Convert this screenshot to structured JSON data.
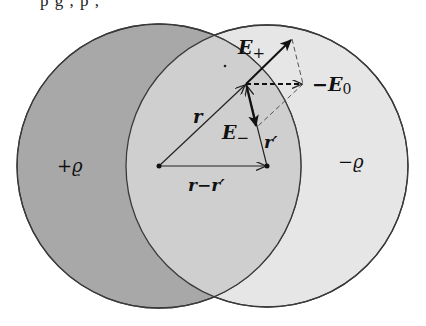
{
  "figure": {
    "top_cut_text": "p  g      ,        p          ,",
    "colors": {
      "background": "#ffffff",
      "left_sphere_fill": "#a8a8a8",
      "right_sphere_fill": "#e6e6e6",
      "overlap_fill": "#cfcfcf",
      "stroke": "#3a3a3a",
      "vector": "#111111",
      "dashed": "#555555"
    },
    "spheres": [
      {
        "name": "positive-sphere",
        "label": "+ϱ",
        "cx": 159,
        "cy": 166,
        "r": 142
      },
      {
        "name": "negative-sphere",
        "label": "−ϱ",
        "cx": 267,
        "cy": 166,
        "r": 141
      }
    ],
    "points": {
      "left_center": [
        159,
        166
      ],
      "right_center": [
        267,
        166
      ],
      "field_point": [
        246,
        84
      ],
      "E_plus_tip": [
        292,
        39
      ],
      "minus_E0_tip": [
        303,
        84
      ],
      "E_minus_tip": [
        257,
        127
      ]
    },
    "labels": {
      "r": "r",
      "r_prime": "r′",
      "r_minus_r_prime": "r−r′",
      "E_plus": "E",
      "E_plus_sub": "+",
      "E_minus": "E",
      "E_minus_sub": "−",
      "minus_E0": "−E",
      "minus_E0_sub": "0",
      "plus_rho": "+ϱ",
      "minus_rho": "−ϱ"
    }
  }
}
